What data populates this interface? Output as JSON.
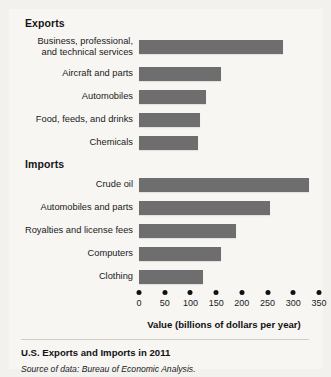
{
  "figure": {
    "caption": "U.S. Exports and Imports in 2011",
    "source": "Source of data: Bureau of Economic Analysis."
  },
  "sections": {
    "exports_label": "Exports",
    "imports_label": "Imports"
  },
  "axis": {
    "title": "Value (billions of dollars per year)",
    "ticks": [
      "0",
      "50",
      "100",
      "150",
      "200",
      "250",
      "300",
      "350"
    ]
  },
  "colors": {
    "bar": "#6e6e6e",
    "panel": "#f7f6f3",
    "page": "#f2f1ee",
    "text": "#1a1a1a"
  },
  "chart_data": {
    "type": "bar",
    "orientation": "horizontal",
    "title": "U.S. Exports and Imports in 2011",
    "xlabel": "Value (billions of dollars per year)",
    "ylabel": "",
    "xlim": [
      0,
      350
    ],
    "xticks": [
      0,
      50,
      100,
      150,
      200,
      250,
      300,
      350
    ],
    "grid": false,
    "legend": null,
    "groups": [
      {
        "name": "Exports",
        "categories": [
          "Business, professional, and technical services",
          "Aircraft and parts",
          "Automobiles",
          "Food, feeds, and drinks",
          "Chemicals"
        ],
        "values": [
          280,
          160,
          130,
          118,
          115
        ]
      },
      {
        "name": "Imports",
        "categories": [
          "Crude oil",
          "Automobiles and parts",
          "Royalties and license fees",
          "Computers",
          "Clothing"
        ],
        "values": [
          330,
          255,
          188,
          160,
          125
        ]
      }
    ]
  },
  "rows": {
    "exports": [
      {
        "label_line1": "Business, professional,",
        "label_line2": "and technical services",
        "value": 280
      },
      {
        "label_line1": "Aircraft and parts",
        "label_line2": "",
        "value": 160
      },
      {
        "label_line1": "Automobiles",
        "label_line2": "",
        "value": 130
      },
      {
        "label_line1": "Food, feeds, and drinks",
        "label_line2": "",
        "value": 118
      },
      {
        "label_line1": "Chemicals",
        "label_line2": "",
        "value": 115
      }
    ],
    "imports": [
      {
        "label_line1": "Crude oil",
        "label_line2": "",
        "value": 330
      },
      {
        "label_line1": "Automobiles and parts",
        "label_line2": "",
        "value": 255
      },
      {
        "label_line1": "Royalties and license fees",
        "label_line2": "",
        "value": 188
      },
      {
        "label_line1": "Computers",
        "label_line2": "",
        "value": 160
      },
      {
        "label_line1": "Clothing",
        "label_line2": "",
        "value": 125
      }
    ]
  }
}
